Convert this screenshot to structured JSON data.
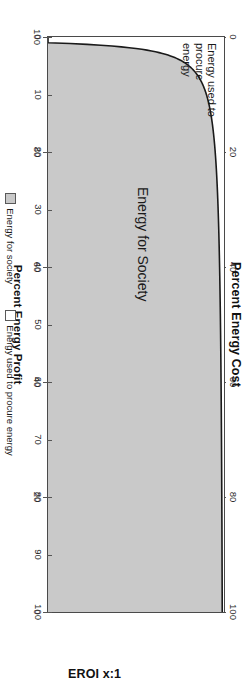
{
  "chart_data": {
    "type": "area",
    "title": "",
    "xlabel": "EROI x:1",
    "x_axis": {
      "label": "EROI x:1",
      "ticks": [
        0,
        10,
        20,
        30,
        40,
        50,
        60,
        70,
        80,
        90,
        100
      ],
      "range": [
        0,
        100
      ]
    },
    "secondary_axes": [
      {
        "id": "cost",
        "label": "Percent Energy Cost",
        "position": "top",
        "ticks": [
          0,
          20,
          40,
          60,
          80,
          100
        ],
        "range": [
          0,
          100
        ]
      },
      {
        "id": "profit",
        "label": "Percent Energy Profit",
        "position": "bottom",
        "ticks": [
          100,
          80,
          60,
          40,
          20,
          0
        ],
        "range": [
          100,
          0
        ]
      }
    ],
    "grid": false,
    "legend_position": "bottom-center",
    "series": [
      {
        "name": "Energy for society",
        "color": "#c9c9c9",
        "type": "area",
        "formula": "percent_energy_profit = 100 * (1 - 1/EROI)",
        "x": [
          1,
          1.25,
          1.5,
          1.75,
          2,
          2.5,
          3,
          3.5,
          4,
          5,
          6,
          7,
          8,
          10,
          12,
          15,
          20,
          25,
          30,
          40,
          50,
          60,
          70,
          80,
          90,
          100
        ],
        "values": [
          0,
          20,
          33.3,
          42.9,
          50,
          60,
          66.7,
          71.4,
          75,
          80,
          83.3,
          85.7,
          87.5,
          90,
          91.7,
          93.3,
          95,
          96,
          96.7,
          97.5,
          98,
          98.3,
          98.6,
          98.8,
          98.9,
          99
        ]
      },
      {
        "name": "Energy used to procure energy",
        "color": "#ffffff",
        "type": "area",
        "formula": "percent_energy_cost = 100 / EROI",
        "x": [
          1,
          1.25,
          1.5,
          1.75,
          2,
          2.5,
          3,
          3.5,
          4,
          5,
          6,
          7,
          8,
          10,
          12,
          15,
          20,
          25,
          30,
          40,
          50,
          60,
          70,
          80,
          90,
          100
        ],
        "values": [
          100,
          80,
          66.7,
          57.1,
          50,
          40,
          33.3,
          28.6,
          25,
          20,
          16.7,
          14.3,
          12.5,
          10,
          8.3,
          6.7,
          5,
          4,
          3.3,
          2.5,
          2,
          1.7,
          1.4,
          1.2,
          1.1,
          1
        ]
      }
    ],
    "annotations": [
      {
        "id": "procure",
        "text": "Energy used to\nprocure\nenergy"
      },
      {
        "id": "society",
        "text": "Energy for Society"
      }
    ]
  },
  "axes": {
    "cost": {
      "title": "Percent Energy Cost",
      "ticks": [
        "0",
        "20",
        "40",
        "60",
        "80",
        "100"
      ]
    },
    "profit": {
      "title": "Percent Energy Profit",
      "ticks": [
        "100",
        "80",
        "60",
        "40",
        "20",
        "0"
      ]
    },
    "eroi": {
      "title": "EROI x:1",
      "ticks": [
        "0",
        "10",
        "20",
        "30",
        "40",
        "50",
        "60",
        "70",
        "80",
        "90",
        "100"
      ]
    }
  },
  "annotations": {
    "procure": "Energy used to\nprocure\nenergy",
    "society": "Energy for Society"
  },
  "legend": {
    "items": [
      {
        "label": "Energy for society",
        "color": "#c9c9c9"
      },
      {
        "label": "Energy used to procure energy",
        "color": "#ffffff"
      }
    ]
  },
  "colors": {
    "area_fill": "#c9c9c9",
    "curve": "#1a1a1a",
    "axis": "#4a4a4a",
    "text": "#1a1a1a",
    "background": "#ffffff"
  }
}
